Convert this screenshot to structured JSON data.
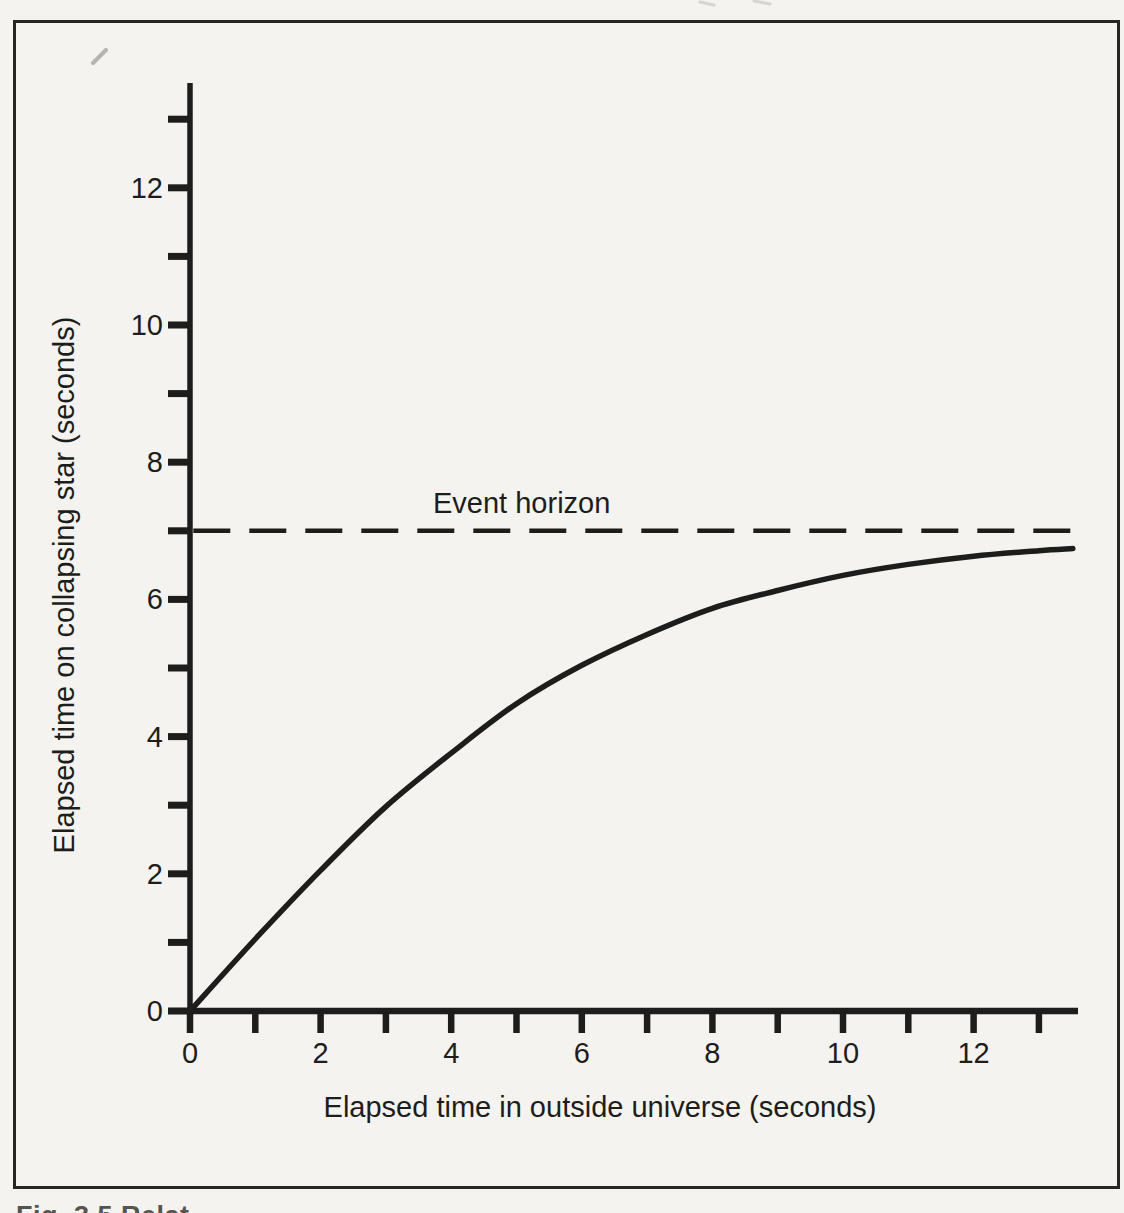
{
  "figure": {
    "caption_fragment": "Fig. 3.5 Relat",
    "ink_color": "#1d1d1b",
    "paper_color": "#f4f3ef"
  },
  "chart_data": {
    "type": "line",
    "title": "",
    "xlabel": "Elapsed time in outside universe (seconds)",
    "ylabel": "Elapsed time on collapsing star (seconds)",
    "xlim": [
      0,
      13.6
    ],
    "ylim": [
      0,
      13.5
    ],
    "grid": false,
    "legend": "none",
    "x_ticks": [
      0,
      1,
      2,
      3,
      4,
      5,
      6,
      7,
      8,
      9,
      10,
      11,
      12,
      13
    ],
    "x_tick_labeled": [
      0,
      2,
      4,
      6,
      8,
      10,
      12
    ],
    "y_ticks": [
      0,
      1,
      2,
      3,
      4,
      5,
      6,
      7,
      8,
      9,
      10,
      11,
      12,
      13
    ],
    "y_tick_labeled": [
      0,
      2,
      4,
      6,
      8,
      10,
      12
    ],
    "reference_line": {
      "y": 7,
      "style": "dashed",
      "label": "Event horizon",
      "x_start": 0.05,
      "x_end": 13.52
    },
    "series": [
      {
        "name": "Elapsed time on collapsing star",
        "asymptote": 7,
        "points": [
          [
            0,
            0
          ],
          [
            1,
            1.05
          ],
          [
            2,
            2.05
          ],
          [
            3,
            2.98
          ],
          [
            4,
            3.76
          ],
          [
            5,
            4.48
          ],
          [
            6,
            5.04
          ],
          [
            7,
            5.49
          ],
          [
            8,
            5.87
          ],
          [
            9,
            6.13
          ],
          [
            10,
            6.35
          ],
          [
            11,
            6.51
          ],
          [
            12,
            6.63
          ],
          [
            13,
            6.71
          ],
          [
            13.52,
            6.74
          ]
        ]
      }
    ]
  }
}
